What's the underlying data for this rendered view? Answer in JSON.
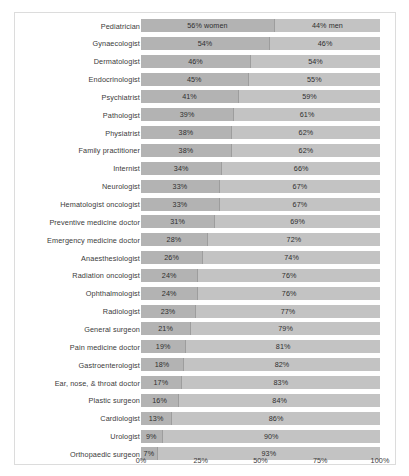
{
  "chart_data": {
    "type": "bar",
    "orientation": "horizontal",
    "stacked": true,
    "stacked_percent": true,
    "title": "",
    "subtitle": "",
    "xlabel": "",
    "ylabel": "",
    "xlim": [
      0,
      100
    ],
    "xticks": [
      "0%",
      "25%",
      "50%",
      "75%",
      "100%"
    ],
    "xtick_values": [
      0,
      25,
      50,
      75,
      100
    ],
    "grid": false,
    "legend": "inline-first-row",
    "series": [
      {
        "name": "women",
        "color": "#b3b3b3",
        "values": [
          56,
          54,
          46,
          45,
          41,
          39,
          38,
          38,
          34,
          33,
          33,
          31,
          28,
          26,
          24,
          24,
          23,
          21,
          19,
          18,
          17,
          16,
          13,
          9,
          7
        ]
      },
      {
        "name": "men",
        "color": "#c3c3c3",
        "values": [
          44,
          46,
          54,
          55,
          59,
          61,
          62,
          62,
          66,
          67,
          67,
          69,
          72,
          74,
          76,
          76,
          77,
          79,
          81,
          82,
          83,
          84,
          86,
          90,
          93
        ]
      }
    ],
    "categories": [
      "Pediatrician",
      "Gynaecologist",
      "Dermatologist",
      "Endocrinologist",
      "Psychiatrist",
      "Pathologist",
      "Physiatrist",
      "Family practitioner",
      "Internist",
      "Neurologist",
      "Hematologist oncologist",
      "Preventive medicine doctor",
      "Emergency medicine doctor",
      "Anaesthesiologist",
      "Radiation oncologist",
      "Ophthalmologist",
      "Radiologist",
      "General surgeon",
      "Pain medicine doctor",
      "Gastroenterologist",
      "Ear, nose, & throat doctor",
      "Plastic surgeon",
      "Cardiologist",
      "Urologist",
      "Orthopaedic surgeon"
    ],
    "rows": [
      {
        "label": "Pediatrician",
        "women": 56,
        "men": 44,
        "women_label": "56% women",
        "men_label": "44% men"
      },
      {
        "label": "Gynaecologist",
        "women": 54,
        "men": 46,
        "women_label": "54%",
        "men_label": "46%"
      },
      {
        "label": "Dermatologist",
        "women": 46,
        "men": 54,
        "women_label": "46%",
        "men_label": "54%"
      },
      {
        "label": "Endocrinologist",
        "women": 45,
        "men": 55,
        "women_label": "45%",
        "men_label": "55%"
      },
      {
        "label": "Psychiatrist",
        "women": 41,
        "men": 59,
        "women_label": "41%",
        "men_label": "59%"
      },
      {
        "label": "Pathologist",
        "women": 39,
        "men": 61,
        "women_label": "39%",
        "men_label": "61%"
      },
      {
        "label": "Physiatrist",
        "women": 38,
        "men": 62,
        "women_label": "38%",
        "men_label": "62%"
      },
      {
        "label": "Family practitioner",
        "women": 38,
        "men": 62,
        "women_label": "38%",
        "men_label": "62%"
      },
      {
        "label": "Internist",
        "women": 34,
        "men": 66,
        "women_label": "34%",
        "men_label": "66%"
      },
      {
        "label": "Neurologist",
        "women": 33,
        "men": 67,
        "women_label": "33%",
        "men_label": "67%"
      },
      {
        "label": "Hematologist oncologist",
        "women": 33,
        "men": 67,
        "women_label": "33%",
        "men_label": "67%"
      },
      {
        "label": "Preventive medicine doctor",
        "women": 31,
        "men": 69,
        "women_label": "31%",
        "men_label": "69%"
      },
      {
        "label": "Emergency medicine doctor",
        "women": 28,
        "men": 72,
        "women_label": "28%",
        "men_label": "72%"
      },
      {
        "label": "Anaesthesiologist",
        "women": 26,
        "men": 74,
        "women_label": "26%",
        "men_label": "74%"
      },
      {
        "label": "Radiation oncologist",
        "women": 24,
        "men": 76,
        "women_label": "24%",
        "men_label": "76%"
      },
      {
        "label": "Ophthalmologist",
        "women": 24,
        "men": 76,
        "women_label": "24%",
        "men_label": "76%"
      },
      {
        "label": "Radiologist",
        "women": 23,
        "men": 77,
        "women_label": "23%",
        "men_label": "77%"
      },
      {
        "label": "General surgeon",
        "women": 21,
        "men": 79,
        "women_label": "21%",
        "men_label": "79%"
      },
      {
        "label": "Pain medicine doctor",
        "women": 19,
        "men": 81,
        "women_label": "19%",
        "men_label": "81%"
      },
      {
        "label": "Gastroenterologist",
        "women": 18,
        "men": 82,
        "women_label": "18%",
        "men_label": "82%"
      },
      {
        "label": "Ear, nose, & throat doctor",
        "women": 17,
        "men": 83,
        "women_label": "17%",
        "men_label": "83%"
      },
      {
        "label": "Plastic surgeon",
        "women": 16,
        "men": 84,
        "women_label": "16%",
        "men_label": "84%"
      },
      {
        "label": "Cardiologist",
        "women": 13,
        "men": 86,
        "women_label": "13%",
        "men_label": "86%"
      },
      {
        "label": "Urologist",
        "women": 9,
        "men": 90,
        "women_label": "9%",
        "men_label": "90%"
      },
      {
        "label": "Orthopaedic surgeon",
        "women": 7,
        "men": 93,
        "women_label": "7%",
        "men_label": "93%"
      }
    ]
  },
  "colors": {
    "women_segment": "#b3b3b3",
    "men_segment": "#c3c3c3",
    "divider": "#9d9d9d",
    "frame_border": "#dcdcdc",
    "text": "#3b3b3b",
    "background": "#ffffff"
  }
}
